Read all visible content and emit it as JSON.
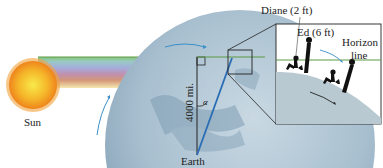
{
  "diagram": {
    "labels": {
      "sun": "Sun",
      "earth": "Earth",
      "radius": "4000 mi.",
      "angle": "α",
      "diane": "Diane (2 ft)",
      "ed": "Ed (6 ft)",
      "horizon_line_1": "Horizon",
      "horizon_line_2": "line"
    },
    "colors": {
      "sun_core": "#f7e23a",
      "sun_edge": "#f08a1c",
      "earth": "#b4c8d6",
      "earth_dark": "#7f9db3",
      "radius_line": "#2a6db5",
      "horizon": "#5a9a45",
      "arrow": "#3a8fc9",
      "inset_ground": "#b9c9d2",
      "silhouette": "#111111"
    }
  }
}
